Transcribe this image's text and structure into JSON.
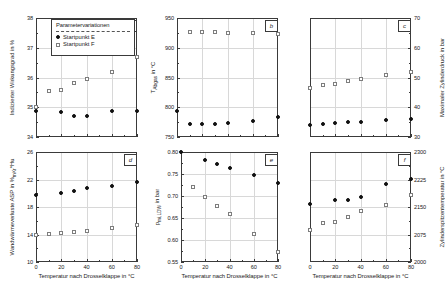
{
  "legend": {
    "title": "Parametervariationen",
    "series": [
      {
        "label": "Startpunkt E",
        "marker": "filled-circle",
        "color": "#111111"
      },
      {
        "label": "Startpunkt F",
        "marker": "open-square",
        "color": "#7d7d7d"
      }
    ]
  },
  "shared": {
    "xlabel": "Temperatur nach Drosselklappe in °C",
    "x_ticks": [
      0,
      20,
      40,
      60,
      80
    ],
    "xlim": [
      0,
      80
    ],
    "x_values": [
      0,
      10,
      20,
      30,
      40,
      60,
      80
    ]
  },
  "chart_data": [
    {
      "type": "scatter",
      "panel_id": "a",
      "title": "",
      "xlabel": "Temperatur nach Drosselklappe in °C",
      "ylabel": "Indizierter Wirkungsgrad in %",
      "ylabel_html": "Indizierter Wirkungsgrad in %",
      "xlim": [
        0,
        80
      ],
      "ylim": [
        34,
        38
      ],
      "y_ticks": [
        34,
        35,
        36,
        37,
        38
      ],
      "grid": true,
      "x": [
        0,
        10,
        20,
        30,
        40,
        60,
        80
      ],
      "series": [
        {
          "name": "Startpunkt E",
          "values": [
            34.88,
            null,
            34.85,
            34.7,
            34.7,
            34.88,
            34.88
          ]
        },
        {
          "name": "Startpunkt F",
          "values": [
            35.02,
            35.55,
            35.57,
            35.82,
            35.95,
            36.18,
            36.68
          ]
        }
      ]
    },
    {
      "type": "scatter",
      "panel_id": "b",
      "title": "",
      "xlabel": "Temperatur nach Drosselklappe in °C",
      "ylabel": "T_Abgas in °C",
      "ylabel_html": "T<sub>Abgas</sub> in °C",
      "xlim": [
        0,
        80
      ],
      "ylim": [
        750,
        950
      ],
      "y_ticks": [
        750,
        800,
        850,
        900,
        950
      ],
      "grid": true,
      "x": [
        0,
        10,
        20,
        30,
        40,
        60,
        80
      ],
      "series": [
        {
          "name": "Startpunkt E",
          "values": [
            793,
            772,
            772,
            772,
            774,
            777,
            783
          ]
        },
        {
          "name": "Startpunkt F",
          "values": [
            null,
            926,
            926,
            926,
            925,
            924,
            923
          ]
        }
      ]
    },
    {
      "type": "scatter",
      "panel_id": "c",
      "title": "",
      "xlabel": "Temperatur nach Drosselklappe in °C",
      "ylabel": "Maximaler Zylinderdruck in bar",
      "ylabel_html": "Maximaler Zylinderdruck in bar",
      "xlim": [
        0,
        80
      ],
      "ylim": [
        30,
        70
      ],
      "y_ticks": [
        30,
        40,
        50,
        60,
        70
      ],
      "grid": true,
      "x": [
        0,
        10,
        20,
        30,
        40,
        60,
        80
      ],
      "series": [
        {
          "name": "Startpunkt E",
          "values": [
            34.0,
            34.3,
            34.6,
            35.0,
            35.1,
            35.7,
            36.2
          ]
        },
        {
          "name": "Startpunkt F",
          "values": [
            46.4,
            47.6,
            47.8,
            48.7,
            49.6,
            51.0,
            52.0
          ]
        }
      ]
    },
    {
      "type": "scatter",
      "panel_id": "d",
      "title": "",
      "xlabel": "Temperatur nach Drosselklappe in °C",
      "ylabel": "Wandwärmeverluste ASP in %mKr*Hu",
      "ylabel_html": "Wandwärmeverluste ASP in %<sub>mKr</sub>*Hu",
      "xlim": [
        0,
        80
      ],
      "ylim": [
        10,
        26
      ],
      "y_ticks": [
        10,
        14,
        18,
        22,
        26
      ],
      "grid": true,
      "x": [
        0,
        10,
        20,
        30,
        40,
        60,
        80
      ],
      "series": [
        {
          "name": "Startpunkt E",
          "values": [
            19.7,
            null,
            20.0,
            20.3,
            20.7,
            21.1,
            21.6
          ]
        },
        {
          "name": "Startpunkt F",
          "values": [
            13.9,
            14.1,
            14.2,
            14.4,
            14.5,
            15.0,
            15.4
          ]
        }
      ]
    },
    {
      "type": "scatter",
      "panel_id": "e",
      "title": "",
      "xlabel": "Temperatur nach Drosselklappe in °C",
      "ylabel": "p_mi,LDW in bar",
      "ylabel_html": "p<sub>mi,LDW</sub> in bar",
      "xlim": [
        0,
        80
      ],
      "ylim": [
        0.55,
        0.8
      ],
      "y_ticks": [
        0.55,
        0.6,
        0.65,
        0.7,
        0.75,
        0.8
      ],
      "grid": true,
      "x": [
        0,
        10,
        20,
        30,
        40,
        60,
        80
      ],
      "series": [
        {
          "name": "Startpunkt E",
          "values": [
            0.799,
            null,
            0.781,
            0.772,
            0.764,
            0.747,
            0.73
          ]
        },
        {
          "name": "Startpunkt F",
          "values": [
            null,
            0.721,
            0.697,
            0.677,
            0.659,
            0.614,
            0.573
          ]
        }
      ]
    },
    {
      "type": "scatter",
      "panel_id": "f",
      "title": "",
      "xlabel": "Temperatur nach Drosselklappe in °C",
      "ylabel": "Zylinderspitzentemperatur in °C",
      "ylabel_html": "Zylinderspitzentemperatur in °C",
      "xlim": [
        0,
        80
      ],
      "ylim": [
        2000,
        2300
      ],
      "y_ticks": [
        2000,
        2075,
        2150,
        2225,
        2300
      ],
      "grid": true,
      "x": [
        0,
        10,
        20,
        30,
        40,
        60,
        80
      ],
      "series": [
        {
          "name": "Startpunkt E",
          "values": [
            2158,
            null,
            2168,
            2170,
            2178,
            2212,
            2226
          ]
        },
        {
          "name": "Startpunkt F",
          "values": [
            2087,
            2106,
            2108,
            2122,
            2140,
            2156,
            2182
          ]
        }
      ]
    }
  ]
}
